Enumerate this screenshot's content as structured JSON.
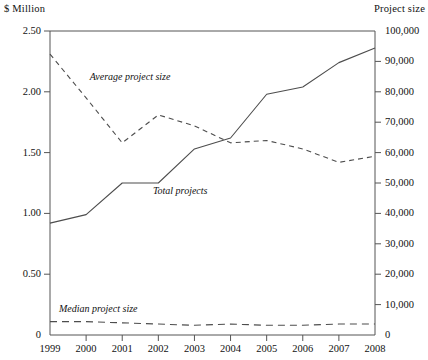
{
  "chart_data": {
    "type": "line",
    "title": "",
    "xlabel": "",
    "ylabel": "$ Million",
    "y2label": "Project size",
    "x": [
      1999,
      2000,
      2001,
      2002,
      2003,
      2004,
      2005,
      2006,
      2007,
      2008
    ],
    "categories": [
      "1999",
      "2000",
      "2001",
      "2002",
      "2003",
      "2004",
      "2005",
      "2006",
      "2007",
      "2008"
    ],
    "ylim": [
      0,
      2.5
    ],
    "y2lim": [
      0,
      100000
    ],
    "grid": false,
    "legend": "inline-annotations",
    "series": [
      {
        "name": "Average project size",
        "axis": "left",
        "style": "dashed",
        "values": [
          2.31,
          1.95,
          1.58,
          1.81,
          1.72,
          1.58,
          1.6,
          1.53,
          1.42,
          1.47
        ]
      },
      {
        "name": "Total projects",
        "axis": "left",
        "style": "solid",
        "values": [
          0.92,
          0.99,
          1.25,
          1.25,
          1.53,
          1.62,
          1.98,
          2.04,
          2.24,
          2.36
        ]
      },
      {
        "name": "Median project size",
        "axis": "left",
        "style": "dashed",
        "values": [
          0.11,
          0.11,
          0.1,
          0.09,
          0.08,
          0.09,
          0.08,
          0.08,
          0.09,
          0.09
        ]
      }
    ],
    "annotations": [
      {
        "text": "Average project size",
        "x": 2000.1,
        "y": 2.11
      },
      {
        "text": "Total projects",
        "x": 2001.85,
        "y": 1.18
      },
      {
        "text": "Median project size",
        "x": 1999.25,
        "y": 0.205
      }
    ],
    "left_axis": {
      "label": "$ Million",
      "ticks": [
        {
          "value": 2.5,
          "label": "2.50"
        },
        {
          "value": 2.0,
          "label": "2.00"
        },
        {
          "value": 1.5,
          "label": "1.50"
        },
        {
          "value": 1.0,
          "label": "1.00"
        },
        {
          "value": 0.5,
          "label": "0.50"
        },
        {
          "value": 0.0,
          "label": "0"
        }
      ]
    },
    "right_axis": {
      "label": "Project size",
      "ticks": [
        {
          "value": 100000,
          "label": "100,000"
        },
        {
          "value": 90000,
          "label": "90,000"
        },
        {
          "value": 80000,
          "label": "80,000"
        },
        {
          "value": 70000,
          "label": "70,000"
        },
        {
          "value": 60000,
          "label": "60,000"
        },
        {
          "value": 50000,
          "label": "50,000"
        },
        {
          "value": 40000,
          "label": "40,000"
        },
        {
          "value": 30000,
          "label": "30,000"
        },
        {
          "value": 20000,
          "label": "20,000"
        },
        {
          "value": 10000,
          "label": "10,000"
        },
        {
          "value": 0,
          "label": "0"
        }
      ]
    },
    "bottom_axis": {
      "ticks": [
        {
          "value": 1999,
          "label": "1999"
        },
        {
          "value": 2000,
          "label": "2000"
        },
        {
          "value": 2001,
          "label": "2001"
        },
        {
          "value": 2002,
          "label": "2002"
        },
        {
          "value": 2003,
          "label": "2003"
        },
        {
          "value": 2004,
          "label": "2004"
        },
        {
          "value": 2005,
          "label": "2005"
        },
        {
          "value": 2006,
          "label": "2006"
        },
        {
          "value": 2007,
          "label": "2007"
        },
        {
          "value": 2008,
          "label": "2008"
        }
      ]
    },
    "colors": {
      "line": "#4d4d4d",
      "axis": "#555555",
      "text": "#111111",
      "background": "#ffffff"
    }
  }
}
